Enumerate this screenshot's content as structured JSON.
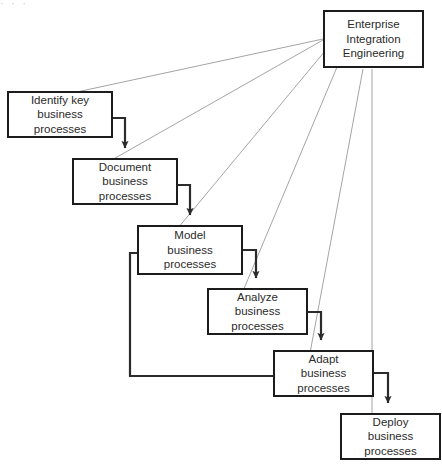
{
  "diagram": {
    "top_text_fragment": "·    ·    ·",
    "colors": {
      "node_border": "#1c1c1c",
      "node_fill": "#ffffff",
      "flow_arrow": "#2b2b2b",
      "governance_line": "#9a9a9a",
      "text": "#2b2b2b",
      "background": "#ffffff"
    },
    "nodes": [
      {
        "id": "enterprise-integration-engineering",
        "lines": [
          "Enterprise",
          "Integration",
          "Engineering"
        ],
        "x": 323,
        "y": 10,
        "w": 101,
        "h": 58
      },
      {
        "id": "identify-key-business-processes",
        "lines": [
          "Identify key",
          "business",
          "processes"
        ],
        "x": 7,
        "y": 91,
        "w": 106,
        "h": 47
      },
      {
        "id": "document-business-processes",
        "lines": [
          "Document",
          "business",
          "processes"
        ],
        "x": 72,
        "y": 158,
        "w": 106,
        "h": 47
      },
      {
        "id": "model-business-processes",
        "lines": [
          "Model",
          "business",
          "processes"
        ],
        "x": 137,
        "y": 225,
        "w": 106,
        "h": 50
      },
      {
        "id": "analyze-business-processes",
        "lines": [
          "Analyze",
          "business",
          "processes"
        ],
        "x": 207,
        "y": 288,
        "w": 101,
        "h": 47
      },
      {
        "id": "adapt-business-processes",
        "lines": [
          "Adapt",
          "business",
          "processes"
        ],
        "x": 273,
        "y": 350,
        "w": 101,
        "h": 47
      },
      {
        "id": "deploy-business-processes",
        "lines": [
          "Deploy",
          "business",
          "processes"
        ],
        "x": 340,
        "y": 413,
        "w": 101,
        "h": 47
      }
    ],
    "flow_edges": [
      {
        "from": "identify-key-business-processes",
        "to": "document-business-processes"
      },
      {
        "from": "document-business-processes",
        "to": "model-business-processes"
      },
      {
        "from": "model-business-processes",
        "to": "analyze-business-processes"
      },
      {
        "from": "analyze-business-processes",
        "to": "adapt-business-processes"
      },
      {
        "from": "adapt-business-processes",
        "to": "deploy-business-processes"
      },
      {
        "from": "adapt-business-processes",
        "to": "model-business-processes",
        "kind": "feedback"
      }
    ],
    "governance_edges": [
      {
        "from": "enterprise-integration-engineering",
        "to": "identify-key-business-processes"
      },
      {
        "from": "enterprise-integration-engineering",
        "to": "document-business-processes"
      },
      {
        "from": "enterprise-integration-engineering",
        "to": "model-business-processes"
      },
      {
        "from": "enterprise-integration-engineering",
        "to": "analyze-business-processes"
      },
      {
        "from": "enterprise-integration-engineering",
        "to": "adapt-business-processes"
      },
      {
        "from": "enterprise-integration-engineering",
        "to": "deploy-business-processes"
      }
    ]
  }
}
